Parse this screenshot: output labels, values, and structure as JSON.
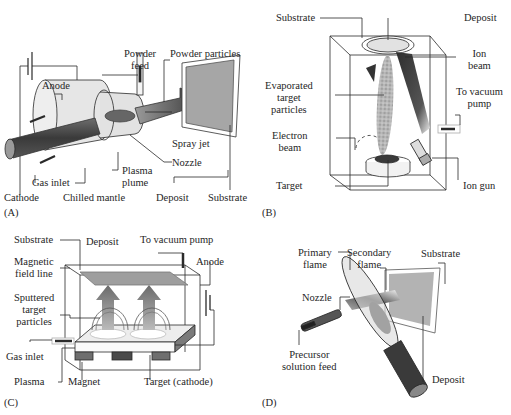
{
  "figure": {
    "panels": [
      {
        "tag": "(A)",
        "title": "Plasma spray",
        "labels": {
          "powder_feed_1": "Powder",
          "powder_feed_2": "feed",
          "powder_particles": "Powder particles",
          "anode": "Anode",
          "spray_jet": "Spray jet",
          "nozzle": "Nozzle",
          "plasma_plume_1": "Plasma",
          "plasma_plume_2": "plume",
          "gas_inlet": "Gas inlet",
          "cathode": "Cathode",
          "chilled_mantle": "Chilled mantle",
          "deposit": "Deposit",
          "substrate": "Substrate"
        }
      },
      {
        "tag": "(B)",
        "title": "Ion-beam assisted evaporation",
        "labels": {
          "substrate": "Substrate",
          "deposit": "Deposit",
          "ion_beam_1": "Ion",
          "ion_beam_2": "beam",
          "evaporated_1": "Evaporated",
          "evaporated_2": "target",
          "evaporated_3": "particles",
          "to_vacuum_pump_1": "To vacuum",
          "to_vacuum_pump_2": "pump",
          "electron_beam_1": "Electron",
          "electron_beam_2": "beam",
          "target": "Target",
          "ion_gun": "Ion gun"
        }
      },
      {
        "tag": "(C)",
        "title": "Magnetron sputtering",
        "labels": {
          "substrate": "Substrate",
          "deposit": "Deposit",
          "to_vacuum_pump": "To vacuum pump",
          "anode": "Anode",
          "magnetic_field_1": "Magnetic",
          "magnetic_field_2": "field line",
          "sputtered_1": "Sputtered",
          "sputtered_2": "target",
          "sputtered_3": "particles",
          "gas_inlet": "Gas inlet",
          "plasma": "Plasma",
          "magnet": "Magnet",
          "target_cathode": "Target (cathode)"
        }
      },
      {
        "tag": "(D)",
        "title": "Flame spray pyrolysis",
        "labels": {
          "primary_flame_1": "Primary",
          "primary_flame_2": "flame",
          "secondary_flame_1": "Secondary",
          "secondary_flame_2": "flame",
          "substrate": "Substrate",
          "nozzle": "Nozzle",
          "precursor_1": "Precursor",
          "precursor_2": "solution feed",
          "deposit": "Deposit"
        }
      }
    ],
    "colors": {
      "line": "#2a2a2a",
      "dark_fill": "#4a4a4a",
      "mid_fill": "#8c8c8c",
      "light_fill": "#d0d0d0",
      "background": "#ffffff"
    }
  }
}
